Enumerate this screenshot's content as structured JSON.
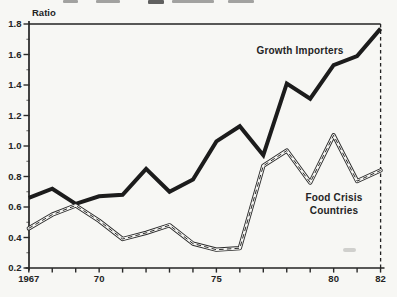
{
  "page": {
    "background_color": "#f7f7f4",
    "ink_color": "#242424"
  },
  "chart_data": {
    "type": "line",
    "title": "",
    "ylabel": "Ratio",
    "xlabel": "",
    "ylim": [
      0.2,
      1.8
    ],
    "xlim": [
      1967,
      1982
    ],
    "grid": false,
    "frame": "box-with-dashed-right-edge",
    "legend": "inline-annotations",
    "x": [
      1967,
      1968,
      1969,
      1970,
      1971,
      1972,
      1973,
      1974,
      1975,
      1976,
      1977,
      1978,
      1979,
      1980,
      1981,
      1982
    ],
    "yticks": [
      0.2,
      0.4,
      0.6,
      0.8,
      1.0,
      1.2,
      1.4,
      1.6,
      1.8
    ],
    "ytick_labels": [
      "0.2",
      "0.4",
      "0.6",
      "0.8",
      "1.0",
      "1.2",
      "1.4",
      "1.6",
      "1.8"
    ],
    "xtick_labels": [
      {
        "year": 1967,
        "label": "1967"
      },
      {
        "year": 1970,
        "label": "70"
      },
      {
        "year": 1975,
        "label": "75"
      },
      {
        "year": 1980,
        "label": "80"
      },
      {
        "year": 1982,
        "label": "82"
      }
    ],
    "series": [
      {
        "name": "Growth Importers",
        "style": "thick-solid",
        "color": "#1c1c1c",
        "values": [
          0.66,
          0.72,
          0.62,
          0.67,
          0.68,
          0.85,
          0.7,
          0.78,
          1.03,
          1.13,
          0.94,
          1.41,
          1.31,
          1.53,
          1.59,
          1.77
        ]
      },
      {
        "name": "Food Crisis Countries",
        "label_lines": [
          "Food Crisis",
          "Countries"
        ],
        "style": "hollow-double-line-dashed-center",
        "color": "#2a2a2a",
        "values": [
          0.46,
          0.55,
          0.61,
          0.51,
          0.39,
          0.43,
          0.48,
          0.36,
          0.32,
          0.33,
          0.87,
          0.97,
          0.76,
          1.07,
          0.77,
          0.84
        ]
      }
    ]
  }
}
